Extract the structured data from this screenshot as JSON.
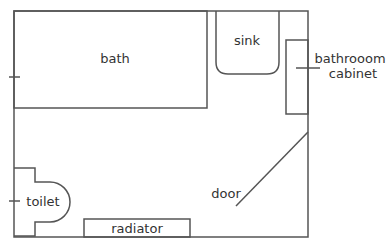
{
  "diagram": {
    "type": "floor-plan",
    "stroke_color": "#555555",
    "text_color": "#333333",
    "labels": {
      "bath": "bath",
      "sink": "sink",
      "cabinet_line1": "bathrooom",
      "cabinet_line2": "cabinet",
      "toilet": "toilet",
      "radiator": "radiator",
      "door": "door"
    }
  }
}
